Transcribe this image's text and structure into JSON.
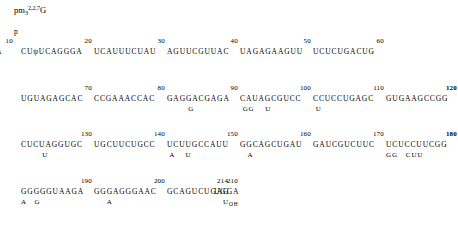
{
  "figure": {
    "cap": {
      "base": "pm",
      "base_sub": "3",
      "superscript": "2,2,7",
      "nucleoside": "G"
    },
    "phosphate_marker": "p",
    "column_x": [
      14,
      95,
      176,
      257,
      338
    ],
    "column_x_row1": [
      14,
      95,
      176,
      257,
      338
    ],
    "rows": [
      {
        "blocks": [
          {
            "number": "",
            "seq": "pAAGACUAψA",
            "sub": "  m",
            "bold": false,
            "x": 14
          },
          {
            "number": "10",
            "seq": "",
            "sub": "",
            "bold": false,
            "x": 14,
            "numonly": true
          },
          {
            "number": "20",
            "seq": "CUψUCAGGGA",
            "sub": "",
            "bold": false,
            "x": 93
          },
          {
            "number": "30",
            "seq": "UCAUUUCUAU",
            "sub": "",
            "bold": false,
            "x": 166
          },
          {
            "number": "40",
            "seq": "AGUUCGUUAC",
            "sub": "",
            "bold": false,
            "x": 239
          },
          {
            "number": "50",
            "seq": "UAGAGAAGUU",
            "sub": "",
            "bold": false,
            "x": 312
          },
          {
            "number": "60",
            "seq": "UCUCUGACUG",
            "sub": "",
            "bold": false,
            "x": 385
          }
        ]
      },
      {
        "blocks": [
          {
            "number": "70",
            "seq": "UGUAGAGCAC",
            "sub": "",
            "bold": false,
            "x": 20
          },
          {
            "number": "80",
            "seq": "CCGAAACCAC",
            "sub": "",
            "bold": false,
            "x": 93
          },
          {
            "number": "90",
            "seq": "GAGGACGAGA",
            "sub": "        G",
            "bold": false,
            "x": 166
          },
          {
            "number": "100",
            "seq": "CAUAGCGUCC",
            "sub": " GG    U",
            "bold": false,
            "x": 239
          },
          {
            "number": "110",
            "seq": "CCUCCUGAGC",
            "sub": " U",
            "bold": false,
            "x": 312
          },
          {
            "number": "120",
            "seq": "GUGAAGCCGG",
            "sub": "",
            "bold": true,
            "x": 385
          }
        ]
      },
      {
        "blocks": [
          {
            "number": "130",
            "seq": "CUCUAGGUGC",
            "sub": "        U",
            "bold": false,
            "x": 20
          },
          {
            "number": "140",
            "seq": "UGCUUCUGCC",
            "sub": "",
            "bold": false,
            "x": 93
          },
          {
            "number": "150",
            "seq": "UCUUGCCAUU",
            "sub": " A    U",
            "bold": false,
            "x": 166
          },
          {
            "number": "160",
            "seq": "GGCAGCUGAU",
            "sub": "   A",
            "bold": false,
            "x": 239
          },
          {
            "number": "170",
            "seq": "GAUCGUCUUC",
            "sub": "",
            "bold": false,
            "x": 312
          },
          {
            "number": "180",
            "seq": "UCUCCUUCGG",
            "sub": "GG   CUU",
            "bold": true,
            "x": 385
          }
        ]
      },
      {
        "blocks": [
          {
            "number": "190",
            "seq": "GGGGGUAAGA",
            "sub": "A   G",
            "bold": false,
            "x": 20
          },
          {
            "number": "200",
            "seq": "GGGAGGGAAC",
            "sub": "     A",
            "bold": false,
            "x": 93
          },
          {
            "number": "210",
            "seq": "GCAGUCUGAG",
            "sub": "",
            "bold": false,
            "x": 166
          },
          {
            "number": "214",
            "seq": "UGGA",
            "sub": "",
            "bold": false,
            "x": 213,
            "terminal": true
          }
        ]
      }
    ],
    "terminal": {
      "residue": "U",
      "modification": "OH"
    }
  }
}
